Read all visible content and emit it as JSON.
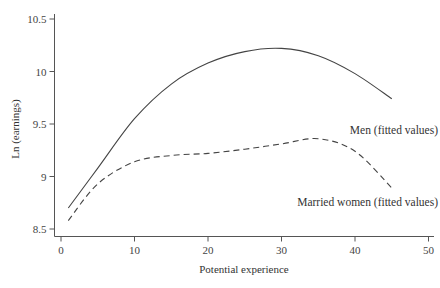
{
  "chart_data": {
    "type": "line",
    "title": "",
    "xlabel": "Potential experience",
    "ylabel": "Ln (earnings)",
    "xlim": [
      0,
      50
    ],
    "ylim": [
      8.5,
      10.5
    ],
    "xticks": [
      0,
      10,
      20,
      30,
      40,
      50
    ],
    "yticks": [
      8.5,
      9,
      9.5,
      10,
      10.5
    ],
    "xtick_labels": [
      "0",
      "10",
      "20",
      "30",
      "40",
      "50"
    ],
    "ytick_labels": [
      "8.5",
      "9",
      "9.5",
      "10",
      "10.5"
    ],
    "grid": false,
    "legend": "inline labels at right end of each curve",
    "x": [
      1,
      5,
      10,
      15,
      20,
      25,
      30,
      35,
      40,
      45
    ],
    "series": [
      {
        "name": "Men (fitted values)",
        "style": "solid",
        "values": [
          8.7,
          9.08,
          9.55,
          9.88,
          10.08,
          10.19,
          10.22,
          10.15,
          9.98,
          9.74
        ]
      },
      {
        "name": "Married women (fitted values)",
        "style": "dashed",
        "values": [
          8.58,
          8.93,
          9.14,
          9.2,
          9.22,
          9.26,
          9.31,
          9.36,
          9.24,
          8.89
        ]
      }
    ]
  },
  "colors": {
    "line": "#444444",
    "axis": "#555555",
    "text": "#333333"
  }
}
